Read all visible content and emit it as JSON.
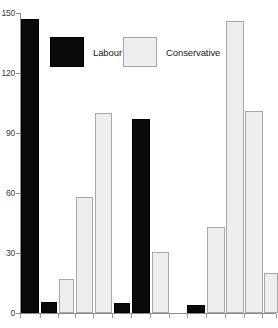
{
  "chart_data": {
    "type": "bar",
    "title": "",
    "subtitle": "",
    "xlabel": "",
    "ylabel": "",
    "ylim": [
      0,
      150
    ],
    "yticks": [
      0,
      30,
      60,
      90,
      120,
      150
    ],
    "ytick_labels": [
      "0",
      "30",
      "60",
      "90",
      "120",
      "150"
    ],
    "grid": false,
    "legend_position": "top",
    "legend": [
      {
        "name": "Labour",
        "color": "#000000"
      },
      {
        "name": "Conservative",
        "color": "#ededed"
      }
    ],
    "categories": [
      "",
      "",
      "",
      "",
      "",
      "",
      "",
      "",
      "",
      "",
      "",
      "",
      ""
    ],
    "bars": [
      {
        "index": 0,
        "series": "Labour",
        "value": 147,
        "x_px": 21,
        "width_px": 18
      },
      {
        "index": 1,
        "series": "Labour",
        "value": 5.5,
        "x_px": 41,
        "width_px": 16
      },
      {
        "index": 2,
        "series": "Conservative",
        "value": 17,
        "x_px": 59,
        "width_px": 15
      },
      {
        "index": 3,
        "series": "Conservative",
        "value": 58,
        "x_px": 76,
        "width_px": 17
      },
      {
        "index": 4,
        "series": "Conservative",
        "value": 100,
        "x_px": 95,
        "width_px": 17
      },
      {
        "index": 5,
        "series": "Labour",
        "value": 5,
        "x_px": 114,
        "width_px": 16
      },
      {
        "index": 6,
        "series": "Labour",
        "value": 97,
        "x_px": 132,
        "width_px": 18
      },
      {
        "index": 7,
        "series": "Conservative",
        "value": 30.5,
        "x_px": 152,
        "width_px": 17
      },
      {
        "index": 8,
        "series": "Labour",
        "value": 4,
        "x_px": 187,
        "width_px": 18
      },
      {
        "index": 9,
        "series": "Conservative",
        "value": 43,
        "x_px": 207,
        "width_px": 18
      },
      {
        "index": 10,
        "series": "Conservative",
        "value": 146,
        "x_px": 226,
        "width_px": 18
      },
      {
        "index": 11,
        "series": "Conservative",
        "value": 101,
        "x_px": 245,
        "width_px": 18
      },
      {
        "index": 12,
        "series": "Conservative",
        "value": 20,
        "x_px": 264,
        "width_px": 14
      }
    ],
    "series": [
      {
        "name": "Labour",
        "color": "#000000",
        "values": [
          147,
          5.5,
          null,
          null,
          null,
          5,
          97,
          null,
          4,
          null,
          null,
          null,
          null
        ]
      },
      {
        "name": "Conservative",
        "color": "#ededed",
        "values": [
          null,
          null,
          17,
          58,
          100,
          null,
          null,
          30.5,
          null,
          43,
          146,
          101,
          20
        ]
      }
    ],
    "x_tick_positions_px": [
      20,
      40,
      58,
      75,
      93,
      112,
      131,
      150,
      169,
      187,
      206,
      225,
      244,
      262,
      276
    ]
  }
}
